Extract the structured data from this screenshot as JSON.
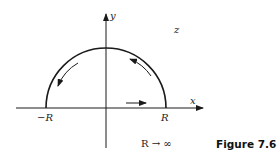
{
  "figure": {
    "caption": "Figure 7.6",
    "plane_label": "z",
    "x_axis_label": "x",
    "y_axis_label": "y",
    "left_point_label": "−R",
    "right_point_label": "R",
    "limit_note": "R → ∞",
    "contour": {
      "shape": "semicircle-upper-half-plane",
      "orientation": "counterclockwise",
      "segments": [
        "real-axis from -R to R",
        "arc from R back to -R"
      ]
    },
    "colors": {
      "stroke": "#1a1a1a",
      "background": "#ffffff"
    }
  }
}
